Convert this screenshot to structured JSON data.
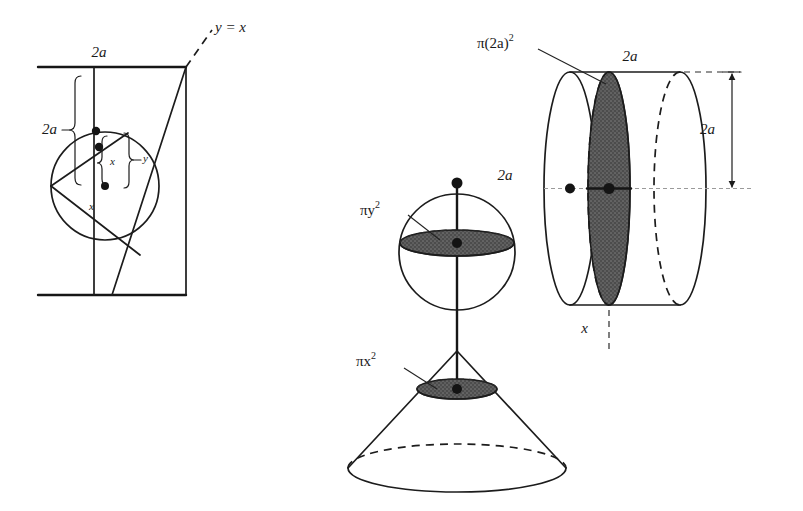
{
  "figure": {
    "background_color": "#ffffff",
    "ink_color": "#1c1c1c",
    "shade_color": "#5b5b5b"
  },
  "left_diagram": {
    "name": "square-with-inscribed-circle",
    "labels": {
      "top_width": "2a",
      "left_height": "2a",
      "diagonal": "y = x",
      "brace_inner": "x",
      "brace_outer": "y",
      "radius_segment": "x"
    }
  },
  "middle_diagram": {
    "name": "sphere-and-cone",
    "labels": {
      "axis_top": "2a",
      "sphere_slice": "πy",
      "sphere_slice_exp": "2",
      "cone_slice": "πx",
      "cone_slice_exp": "2"
    }
  },
  "right_diagram": {
    "name": "cylinder",
    "labels": {
      "top_width": "2a",
      "height_dimension": "2a",
      "slice": "π(2a)",
      "slice_exp": "2",
      "bottom_position": "x"
    }
  }
}
